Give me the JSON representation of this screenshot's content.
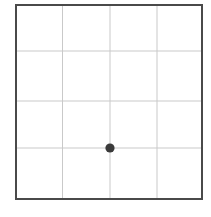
{
  "figure": {
    "title": "",
    "background_color": "#ffffff",
    "width": 211,
    "height": 217
  },
  "chart_data": {
    "type": "scatter",
    "title": "",
    "subtitle": "",
    "xlabel": "",
    "ylabel": "",
    "grid": true,
    "legend": null,
    "legend_position": "none",
    "xlim": [
      0,
      4
    ],
    "ylim": [
      0,
      4
    ],
    "xticks": [
      0,
      1,
      2,
      3,
      4
    ],
    "yticks": [
      0,
      4,
      3,
      2,
      1,
      0
    ],
    "xtick_labels": [
      "",
      "",
      "",
      "",
      ""
    ],
    "ytick_labels": [
      "",
      "",
      "",
      "",
      ""
    ],
    "grid_columns": 4,
    "grid_rows": 4,
    "points": [
      {
        "label": "point",
        "x": 2,
        "y": 1
      }
    ],
    "series": [
      {
        "name": "point",
        "x": [
          2
        ],
        "y": [
          1
        ],
        "marker": "circle",
        "marker_size": 9,
        "color": "#3a3a3a"
      }
    ]
  },
  "style": {
    "border_color": "#4a4a4a",
    "border_width": 2,
    "gridline_color": "#c9c9c9",
    "gridline_width": 1,
    "point_color": "#3a3a3a",
    "plot_background": "#ffffff"
  },
  "geometry": {
    "plot_left": 15,
    "plot_top": 4,
    "plot_right": 203,
    "plot_bottom": 200,
    "vertical_gridlines_x": [
      62.5,
      110,
      157
    ],
    "horizontal_gridlines_y": [
      51,
      101,
      148
    ],
    "point_center_x": 110,
    "point_center_y": 148,
    "point_radius": 4.6
  },
  "icons": {
    "data_point": "filled-circle-marker"
  }
}
